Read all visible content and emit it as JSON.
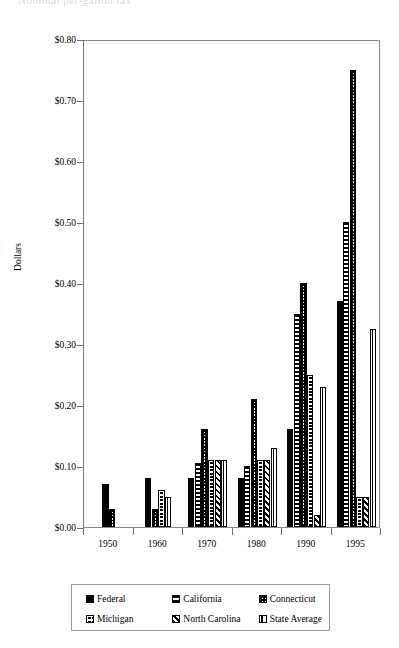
{
  "title_remnant": "Nominal per-gallon tax",
  "axes": {
    "ylabel": "Dollars",
    "yticks": [
      "$0.80",
      "$0.70",
      "$0.60",
      "$0.50",
      "$0.40",
      "$0.30",
      "$0.20",
      "$0.10",
      "$0.00"
    ],
    "xticks": [
      "1950",
      "1960",
      "1970",
      "1980",
      "1990",
      "1995"
    ]
  },
  "legend": {
    "rows": [
      [
        {
          "label": "Federal",
          "pattern": "p-solid"
        },
        {
          "label": "California",
          "pattern": "p-hlines"
        },
        {
          "label": "Connecticut",
          "pattern": "p-checker"
        }
      ],
      [
        {
          "label": "Michigan",
          "pattern": "p-grid"
        },
        {
          "label": "North Carolina",
          "pattern": "p-diag"
        },
        {
          "label": "State Average",
          "pattern": "p-vbar"
        }
      ]
    ]
  },
  "chart_data": {
    "type": "bar",
    "title": "",
    "xlabel": "",
    "ylabel": "Dollars",
    "ylim": [
      0,
      0.8
    ],
    "ytick_step": 0.1,
    "grid": false,
    "legend_position": "bottom",
    "categories": [
      "1950",
      "1960",
      "1970",
      "1980",
      "1990",
      "1995"
    ],
    "series": [
      {
        "name": "Federal",
        "pattern": "solid-black",
        "values": [
          0.07,
          0.08,
          0.08,
          0.08,
          0.16,
          0.37
        ]
      },
      {
        "name": "California",
        "pattern": "horizontal-lines",
        "values": [
          null,
          null,
          0.105,
          0.1,
          0.35,
          0.5
        ]
      },
      {
        "name": "Connecticut",
        "pattern": "checkerboard",
        "values": [
          0.03,
          0.03,
          0.16,
          0.21,
          0.4,
          0.75
        ]
      },
      {
        "name": "Michigan",
        "pattern": "grid",
        "values": [
          null,
          0.06,
          0.11,
          0.11,
          0.25,
          0.05
        ]
      },
      {
        "name": "North Carolina",
        "pattern": "diagonal-hatch",
        "values": [
          null,
          null,
          0.11,
          0.11,
          0.02,
          0.05
        ]
      },
      {
        "name": "State Average",
        "pattern": "vertical-bar",
        "values": [
          null,
          0.05,
          0.11,
          0.13,
          0.23,
          0.325
        ]
      }
    ]
  }
}
